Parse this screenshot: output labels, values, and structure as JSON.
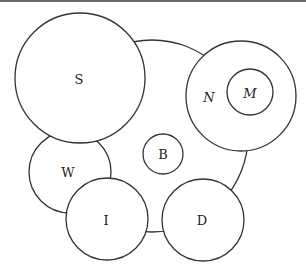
{
  "diagram": {
    "type": "circle-overlap-diagram",
    "stroke_color": "#333333",
    "background_color": "#ffffff",
    "border_color": "#6b6b6b",
    "circles": [
      {
        "id": "big",
        "label": "",
        "cx": 152,
        "cy": 136,
        "r": 96
      },
      {
        "id": "S",
        "label": "S",
        "cx": 80,
        "cy": 78,
        "r": 65,
        "label_x": 79,
        "label_y": 84
      },
      {
        "id": "N",
        "label": "N",
        "cx": 241,
        "cy": 96,
        "r": 55,
        "label_x": 209,
        "label_y": 102
      },
      {
        "id": "M",
        "label": "M",
        "cx": 250,
        "cy": 92,
        "r": 23,
        "label_x": 250,
        "label_y": 98
      },
      {
        "id": "B",
        "label": "B",
        "cx": 163,
        "cy": 154,
        "r": 20,
        "label_x": 163,
        "label_y": 159
      },
      {
        "id": "W",
        "label": "W",
        "cx": 70,
        "cy": 172,
        "r": 41,
        "label_x": 68,
        "label_y": 177
      },
      {
        "id": "I",
        "label": "I",
        "cx": 107,
        "cy": 219,
        "r": 41,
        "label_x": 106,
        "label_y": 225
      },
      {
        "id": "D",
        "label": "D",
        "cx": 203,
        "cy": 220,
        "r": 41,
        "label_x": 202,
        "label_y": 225
      }
    ]
  }
}
